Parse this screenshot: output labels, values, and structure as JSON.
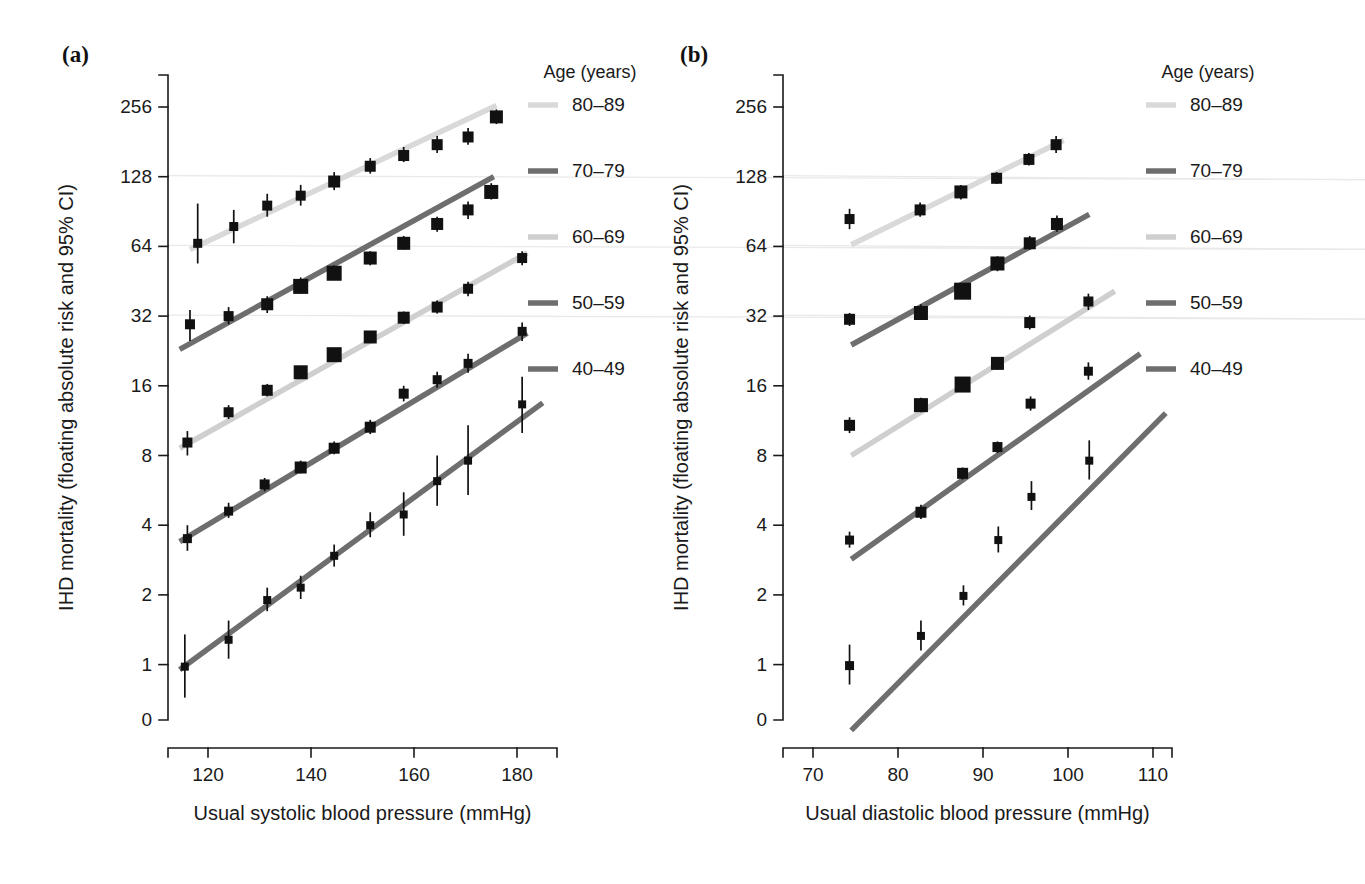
{
  "figure": {
    "background": "#ffffff",
    "panels": [
      {
        "id": "a",
        "label": "(a)"
      },
      {
        "id": "b",
        "label": "(b)"
      }
    ]
  },
  "legend": {
    "title": "Age (years)",
    "entries": [
      {
        "label": "80–89",
        "color": "#d9d9d9"
      },
      {
        "label": "70–79",
        "color": "#6e6e6e"
      },
      {
        "label": "60–69",
        "color": "#cfcfcf"
      },
      {
        "label": "50–59",
        "color": "#6e6e6e"
      },
      {
        "label": "40–49",
        "color": "#6e6e6e"
      }
    ]
  },
  "chart_data": [
    {
      "type": "scatter",
      "panel": "(a)",
      "title": "",
      "xlabel": "Usual systolic blood pressure (mmHg)",
      "ylabel": "IHD mortality (floating absolute risk and 95% CI)",
      "xlim": [
        112,
        188
      ],
      "ylim": [
        0.7,
        360
      ],
      "yscale": "log2",
      "xticks": [
        120,
        140,
        160,
        180
      ],
      "yticks": [
        1,
        2,
        4,
        8,
        16,
        32,
        64,
        128,
        256
      ],
      "grid": "horizontal-faint",
      "legend_position": "right",
      "series": [
        {
          "name": "80–89",
          "color": "#d9d9d9",
          "fit_line": {
            "x0": 116.5,
            "y0": 62,
            "x1": 176,
            "y1": 260
          },
          "points": [
            {
              "x": 118.0,
              "y": 66,
              "lo": 54,
              "hi": 98,
              "size": 9
            },
            {
              "x": 125.0,
              "y": 78,
              "lo": 66,
              "hi": 92,
              "size": 9
            },
            {
              "x": 131.5,
              "y": 96,
              "lo": 86,
              "hi": 108,
              "size": 10
            },
            {
              "x": 138.0,
              "y": 106,
              "lo": 96,
              "hi": 118,
              "size": 10
            },
            {
              "x": 144.5,
              "y": 122,
              "lo": 112,
              "hi": 134,
              "size": 12
            },
            {
              "x": 151.5,
              "y": 142,
              "lo": 132,
              "hi": 154,
              "size": 11
            },
            {
              "x": 158.0,
              "y": 158,
              "lo": 148,
              "hi": 172,
              "size": 11
            },
            {
              "x": 164.5,
              "y": 176,
              "lo": 162,
              "hi": 192,
              "size": 11
            },
            {
              "x": 170.5,
              "y": 190,
              "lo": 176,
              "hi": 208,
              "size": 11
            },
            {
              "x": 176.0,
              "y": 232,
              "lo": 216,
              "hi": 250,
              "size": 13
            }
          ]
        },
        {
          "name": "70–79",
          "color": "#6e6e6e",
          "fit_line": {
            "x0": 114.5,
            "y0": 23,
            "x1": 175.5,
            "y1": 128
          },
          "points": [
            {
              "x": 116.5,
              "y": 29.5,
              "lo": 25,
              "hi": 34,
              "size": 10
            },
            {
              "x": 124.0,
              "y": 32,
              "lo": 29.5,
              "hi": 35,
              "size": 10
            },
            {
              "x": 131.5,
              "y": 36,
              "lo": 33,
              "hi": 39,
              "size": 12
            },
            {
              "x": 138.0,
              "y": 43,
              "lo": 40,
              "hi": 47,
              "size": 15
            },
            {
              "x": 144.5,
              "y": 49,
              "lo": 46,
              "hi": 53,
              "size": 15
            },
            {
              "x": 151.5,
              "y": 57,
              "lo": 53,
              "hi": 61,
              "size": 13
            },
            {
              "x": 158.0,
              "y": 66,
              "lo": 62,
              "hi": 71,
              "size": 13
            },
            {
              "x": 164.5,
              "y": 80,
              "lo": 74,
              "hi": 86,
              "size": 12
            },
            {
              "x": 170.5,
              "y": 92,
              "lo": 84,
              "hi": 100,
              "size": 11
            },
            {
              "x": 175.0,
              "y": 110,
              "lo": 102,
              "hi": 120,
              "size": 14
            }
          ]
        },
        {
          "name": "60–69",
          "color": "#cfcfcf",
          "fit_line": {
            "x0": 114.5,
            "y0": 8.6,
            "x1": 182,
            "y1": 60
          },
          "points": [
            {
              "x": 116.0,
              "y": 9.1,
              "lo": 8.0,
              "hi": 10.2,
              "size": 10
            },
            {
              "x": 124.0,
              "y": 12.3,
              "lo": 11.5,
              "hi": 13.2,
              "size": 10
            },
            {
              "x": 131.5,
              "y": 15.3,
              "lo": 14.4,
              "hi": 16.3,
              "size": 11
            },
            {
              "x": 138.0,
              "y": 18.3,
              "lo": 17.2,
              "hi": 19.5,
              "size": 14
            },
            {
              "x": 144.5,
              "y": 21.8,
              "lo": 20.6,
              "hi": 23.1,
              "size": 15
            },
            {
              "x": 151.5,
              "y": 26.0,
              "lo": 24.5,
              "hi": 27.6,
              "size": 13
            },
            {
              "x": 158.0,
              "y": 31.5,
              "lo": 29.6,
              "hi": 33.5,
              "size": 12
            },
            {
              "x": 164.5,
              "y": 35.0,
              "lo": 32.8,
              "hi": 37.4,
              "size": 11
            },
            {
              "x": 170.5,
              "y": 42.0,
              "lo": 39.0,
              "hi": 45.0,
              "size": 10
            },
            {
              "x": 181.0,
              "y": 57.0,
              "lo": 53.0,
              "hi": 61.0,
              "size": 10
            }
          ]
        },
        {
          "name": "50–59",
          "color": "#6e6e6e",
          "fit_line": {
            "x0": 114.5,
            "y0": 3.4,
            "x1": 182,
            "y1": 27
          },
          "points": [
            {
              "x": 116.0,
              "y": 3.5,
              "lo": 3.1,
              "hi": 4.0,
              "size": 9
            },
            {
              "x": 124.0,
              "y": 4.6,
              "lo": 4.3,
              "hi": 5.0,
              "size": 9
            },
            {
              "x": 131.0,
              "y": 6.0,
              "lo": 5.6,
              "hi": 6.4,
              "size": 10
            },
            {
              "x": 138.0,
              "y": 7.1,
              "lo": 6.7,
              "hi": 7.6,
              "size": 12
            },
            {
              "x": 144.5,
              "y": 8.6,
              "lo": 8.1,
              "hi": 9.2,
              "size": 11
            },
            {
              "x": 151.5,
              "y": 10.6,
              "lo": 9.9,
              "hi": 11.4,
              "size": 11
            },
            {
              "x": 158.0,
              "y": 14.8,
              "lo": 13.7,
              "hi": 16.0,
              "size": 10
            },
            {
              "x": 164.5,
              "y": 17.0,
              "lo": 15.7,
              "hi": 18.4,
              "size": 9
            },
            {
              "x": 170.5,
              "y": 20.0,
              "lo": 18.2,
              "hi": 22.0,
              "size": 9
            },
            {
              "x": 181.0,
              "y": 27.5,
              "lo": 25.0,
              "hi": 30.0,
              "size": 9
            }
          ]
        },
        {
          "name": "40–49",
          "color": "#6e6e6e",
          "fit_line": {
            "x0": 114.5,
            "y0": 0.95,
            "x1": 185,
            "y1": 13.5
          },
          "points": [
            {
              "x": 115.5,
              "y": 0.98,
              "lo": 0.72,
              "hi": 1.35,
              "size": 8
            },
            {
              "x": 124.0,
              "y": 1.28,
              "lo": 1.06,
              "hi": 1.55,
              "size": 8
            },
            {
              "x": 131.5,
              "y": 1.9,
              "lo": 1.7,
              "hi": 2.15,
              "size": 8
            },
            {
              "x": 138.0,
              "y": 2.15,
              "lo": 1.92,
              "hi": 2.42,
              "size": 8
            },
            {
              "x": 144.5,
              "y": 2.95,
              "lo": 2.65,
              "hi": 3.3,
              "size": 8
            },
            {
              "x": 151.5,
              "y": 4.0,
              "lo": 3.55,
              "hi": 4.55,
              "size": 8
            },
            {
              "x": 158.0,
              "y": 4.45,
              "lo": 3.6,
              "hi": 5.55,
              "size": 8
            },
            {
              "x": 164.5,
              "y": 6.2,
              "lo": 4.85,
              "hi": 8.0,
              "size": 8
            },
            {
              "x": 170.5,
              "y": 7.6,
              "lo": 5.4,
              "hi": 10.8,
              "size": 8
            },
            {
              "x": 181.0,
              "y": 13.3,
              "lo": 10.0,
              "hi": 17.5,
              "size": 8
            }
          ]
        }
      ]
    },
    {
      "type": "scatter",
      "panel": "(b)",
      "title": "",
      "xlabel": "Usual diastolic blood pressure (mmHg)",
      "ylabel": "IHD mortality (floating absolute risk and 95% CI)",
      "xlim": [
        66.5,
        114
      ],
      "ylim": [
        0.7,
        360
      ],
      "yscale": "log2",
      "xticks": [
        70,
        80,
        90,
        100,
        110
      ],
      "yticks": [
        1,
        2,
        4,
        8,
        16,
        32,
        64,
        128,
        256
      ],
      "grid": "horizontal-faint",
      "legend_position": "right",
      "series": [
        {
          "name": "80–89",
          "color": "#d9d9d9",
          "fit_line": {
            "x0": 74.5,
            "y0": 65,
            "x1": 99.5,
            "y1": 184
          },
          "points": [
            {
              "x": 74.3,
              "y": 84,
              "lo": 76,
              "hi": 93,
              "size": 10
            },
            {
              "x": 82.6,
              "y": 92,
              "lo": 86,
              "hi": 99,
              "size": 11
            },
            {
              "x": 87.4,
              "y": 110,
              "lo": 102,
              "hi": 118,
              "size": 13
            },
            {
              "x": 91.6,
              "y": 126,
              "lo": 119,
              "hi": 134,
              "size": 11
            },
            {
              "x": 95.4,
              "y": 152,
              "lo": 143,
              "hi": 162,
              "size": 11
            },
            {
              "x": 98.6,
              "y": 176,
              "lo": 162,
              "hi": 192,
              "size": 11
            }
          ]
        },
        {
          "name": "70–79",
          "color": "#6e6e6e",
          "fit_line": {
            "x0": 74.5,
            "y0": 24,
            "x1": 102.5,
            "y1": 88
          },
          "points": [
            {
              "x": 74.3,
              "y": 31,
              "lo": 29,
              "hi": 33,
              "size": 11
            },
            {
              "x": 82.7,
              "y": 33,
              "lo": 31,
              "hi": 36,
              "size": 14
            },
            {
              "x": 87.6,
              "y": 41,
              "lo": 38,
              "hi": 44,
              "size": 17
            },
            {
              "x": 91.7,
              "y": 54,
              "lo": 50,
              "hi": 58,
              "size": 14
            },
            {
              "x": 95.5,
              "y": 66,
              "lo": 62,
              "hi": 71,
              "size": 12
            },
            {
              "x": 98.7,
              "y": 80,
              "lo": 74,
              "hi": 87,
              "size": 12
            }
          ]
        },
        {
          "name": "60–69",
          "color": "#cfcfcf",
          "fit_line": {
            "x0": 74.5,
            "y0": 8.0,
            "x1": 105.5,
            "y1": 41
          },
          "points": [
            {
              "x": 74.3,
              "y": 10.8,
              "lo": 10.0,
              "hi": 11.7,
              "size": 11
            },
            {
              "x": 82.7,
              "y": 13.2,
              "lo": 12.3,
              "hi": 14.2,
              "size": 14
            },
            {
              "x": 87.6,
              "y": 16.2,
              "lo": 15.2,
              "hi": 17.3,
              "size": 16
            },
            {
              "x": 91.7,
              "y": 20.0,
              "lo": 18.8,
              "hi": 21.3,
              "size": 13
            },
            {
              "x": 95.5,
              "y": 30.0,
              "lo": 28.0,
              "hi": 32.2,
              "size": 11
            },
            {
              "x": 102.4,
              "y": 37.0,
              "lo": 34.0,
              "hi": 40.0,
              "size": 10
            }
          ]
        },
        {
          "name": "50–59",
          "color": "#6e6e6e",
          "fit_line": {
            "x0": 74.5,
            "y0": 2.85,
            "x1": 108.5,
            "y1": 22
          },
          "points": [
            {
              "x": 74.3,
              "y": 3.45,
              "lo": 3.2,
              "hi": 3.75,
              "size": 9
            },
            {
              "x": 82.7,
              "y": 4.55,
              "lo": 4.25,
              "hi": 4.9,
              "size": 11
            },
            {
              "x": 87.6,
              "y": 6.7,
              "lo": 6.3,
              "hi": 7.1,
              "size": 11
            },
            {
              "x": 91.7,
              "y": 8.7,
              "lo": 8.2,
              "hi": 9.2,
              "size": 10
            },
            {
              "x": 95.6,
              "y": 13.4,
              "lo": 12.5,
              "hi": 14.4,
              "size": 10
            },
            {
              "x": 102.4,
              "y": 18.5,
              "lo": 17.0,
              "hi": 20.2,
              "size": 9
            }
          ]
        },
        {
          "name": "40–49",
          "color": "#6e6e6e",
          "fit_line": {
            "x0": 74.5,
            "y0": 0.52,
            "x1": 111.5,
            "y1": 12.2
          },
          "points": [
            {
              "x": 74.3,
              "y": 0.99,
              "lo": 0.82,
              "hi": 1.22,
              "size": 9
            },
            {
              "x": 82.7,
              "y": 1.33,
              "lo": 1.15,
              "hi": 1.55,
              "size": 8
            },
            {
              "x": 87.7,
              "y": 1.98,
              "lo": 1.8,
              "hi": 2.2,
              "size": 8
            },
            {
              "x": 91.8,
              "y": 3.45,
              "lo": 3.05,
              "hi": 3.95,
              "size": 8
            },
            {
              "x": 95.7,
              "y": 5.3,
              "lo": 4.65,
              "hi": 6.2,
              "size": 8
            },
            {
              "x": 102.5,
              "y": 7.6,
              "lo": 6.3,
              "hi": 9.3,
              "size": 8
            }
          ]
        }
      ]
    }
  ]
}
